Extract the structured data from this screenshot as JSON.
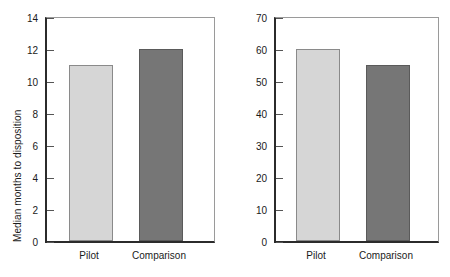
{
  "chart_data": [
    {
      "type": "bar",
      "panel": "left",
      "title": "",
      "xlabel": "",
      "ylabel": "Median months to disposition",
      "categories": [
        "Pilot",
        "Comparison"
      ],
      "values": [
        11,
        12
      ],
      "ylim": [
        0,
        14
      ],
      "yticks": [
        0,
        2,
        4,
        6,
        8,
        10,
        12,
        14
      ],
      "ytick_labels": [
        "0",
        "2",
        "4",
        "6",
        "8",
        "10",
        "12",
        "14"
      ],
      "grid": false,
      "legend": "none",
      "series": [
        {
          "name": "Pilot",
          "values": [
            11
          ],
          "color": "#d6d6d6"
        },
        {
          "name": "Comparison",
          "values": [
            12
          ],
          "color": "#767676"
        }
      ]
    },
    {
      "type": "bar",
      "panel": "right",
      "title": "",
      "xlabel": "",
      "ylabel": "Median lawyer work hours",
      "categories": [
        "Pilot",
        "Comparison"
      ],
      "values": [
        60,
        55
      ],
      "ylim": [
        0,
        70
      ],
      "yticks": [
        0,
        10,
        20,
        30,
        40,
        50,
        60,
        70
      ],
      "ytick_labels": [
        "0",
        "10",
        "20",
        "30",
        "40",
        "50",
        "60",
        "70"
      ],
      "grid": false,
      "legend": "none",
      "series": [
        {
          "name": "Pilot",
          "values": [
            60
          ],
          "color": "#d6d6d6"
        },
        {
          "name": "Comparison",
          "values": [
            55
          ],
          "color": "#767676"
        }
      ]
    }
  ],
  "colors": {
    "pilot_bar": "#d6d6d6",
    "comparison_bar": "#767676",
    "axis": "#2b2b2b",
    "frame": "#9a9a9a",
    "background": "#ffffff"
  }
}
